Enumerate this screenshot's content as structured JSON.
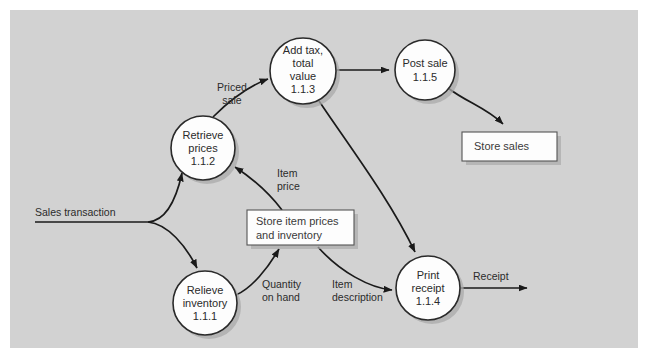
{
  "diagram": {
    "type": "data-flow-diagram",
    "background_color": "#d2d2d2",
    "canvas_color": "#ffffff",
    "node_fill": "#fdfdfd",
    "stroke_color": "#1a1a1a"
  },
  "processes": [
    {
      "id": "p112",
      "label_lines": [
        "Retrieve",
        "prices",
        "1.1.2"
      ],
      "line1": "Retrieve",
      "line2": "prices",
      "number": "1.1.2",
      "cx": 203,
      "cy": 148,
      "r": 32
    },
    {
      "id": "p113",
      "label_lines": [
        "Add tax,",
        "total",
        "value",
        "1.1.3"
      ],
      "line1": "Add tax,",
      "line2": "total",
      "line3": "value",
      "number": "1.1.3",
      "cx": 303,
      "cy": 71,
      "r": 33
    },
    {
      "id": "p115",
      "label_lines": [
        "Post sale",
        "1.1.5"
      ],
      "line1": "Post sale",
      "number": "1.1.5",
      "cx": 425,
      "cy": 70,
      "r": 30
    },
    {
      "id": "p111",
      "label_lines": [
        "Relieve",
        "inventory",
        "1.1.1"
      ],
      "line1": "Relieve",
      "line2": "inventory",
      "number": "1.1.1",
      "cx": 205,
      "cy": 303,
      "r": 32
    },
    {
      "id": "p114",
      "label_lines": [
        "Print",
        "receipt",
        "1.1.4"
      ],
      "line1": "Print",
      "line2": "receipt",
      "number": "1.1.4",
      "cx": 428,
      "cy": 288,
      "r": 32
    }
  ],
  "data_stores": [
    {
      "id": "store-sales",
      "line1": "Store sales",
      "line2": "",
      "x": 462,
      "y": 132,
      "width": 95,
      "height": 29
    },
    {
      "id": "store-item-prices",
      "line1": "Store item prices",
      "line2": "and inventory",
      "x": 247,
      "y": 210,
      "width": 107,
      "height": 35
    }
  ],
  "flows": [
    {
      "id": "sales-transaction",
      "label_line1": "Sales transaction",
      "label_line2": "",
      "label_x": 72,
      "label_y": 213
    },
    {
      "id": "priced-sale",
      "label_line1": "Priced",
      "label_line2": "sale",
      "label_x": 228,
      "label_y": 88
    },
    {
      "id": "item-price",
      "label_line1": "Item",
      "label_line2": "price",
      "label_x": 291,
      "label_y": 174
    },
    {
      "id": "quantity-on-hand",
      "label_line1": "Quantity",
      "label_line2": "on hand",
      "label_x": 284,
      "label_y": 291
    },
    {
      "id": "item-description",
      "label_line1": "Item",
      "label_line2": "description",
      "label_x": 358,
      "label_y": 291
    },
    {
      "id": "receipt",
      "label_line1": "Receipt",
      "label_line2": "",
      "label_x": 492,
      "label_y": 277
    }
  ]
}
